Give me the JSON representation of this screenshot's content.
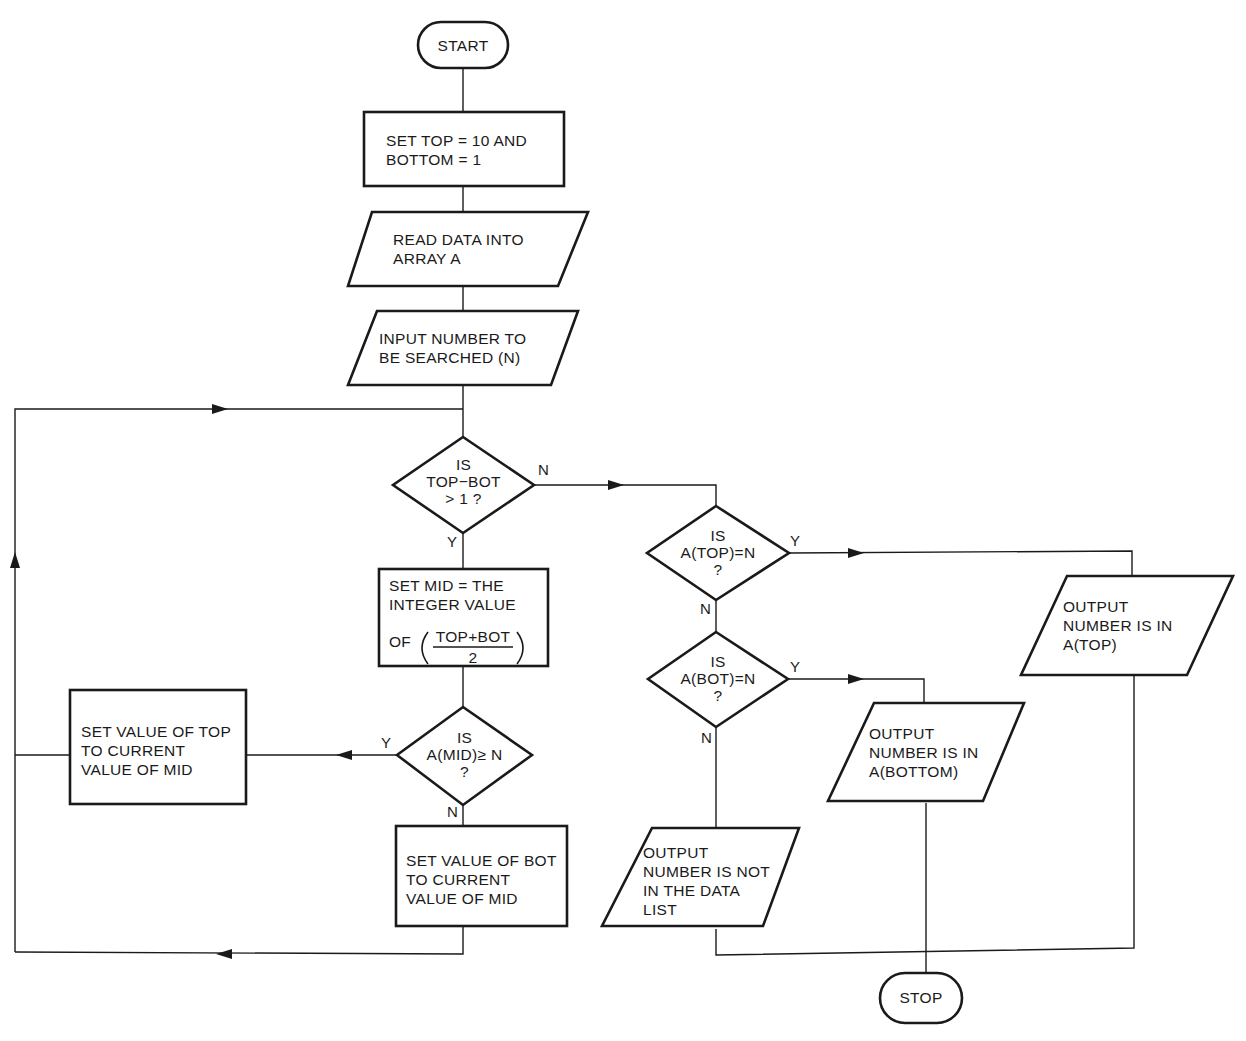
{
  "flowchart": {
    "start": "START",
    "stop": "STOP",
    "init": "SET TOP = 10 AND\nBOTTOM = 1",
    "read": "READ DATA INTO\nARRAY A",
    "input": "INPUT NUMBER TO\nBE SEARCHED (N)",
    "decision_range": "IS\nTOP−BOT\n> 1 ?",
    "set_mid_line1": "SET MID = THE\nINTEGER VALUE",
    "set_mid_of": "OF",
    "set_mid_num": "TOP+BOT",
    "set_mid_den": "2",
    "decision_mid": "IS\nA(MID)≥ N\n?",
    "set_top": "SET VALUE OF TOP\nTO CURRENT\nVALUE OF MID",
    "set_bot": "SET VALUE OF BOT\nTO CURRENT\nVALUE OF MID",
    "decision_top": "IS\nA(TOP)=N\n?",
    "decision_bot": "IS\nA(BOT)=N\n?",
    "out_top": "OUTPUT\nNUMBER IS IN\nA(TOP)",
    "out_bottom": "OUTPUT\nNUMBER IS IN\nA(BOTTOM)",
    "out_not_found": "OUTPUT\nNUMBER IS NOT\nIN THE DATA\nLIST",
    "labels": {
      "range_no": "N",
      "range_yes": "Y",
      "mid_yes": "Y",
      "mid_no": "N",
      "top_yes": "Y",
      "top_no": "N",
      "bot_yes": "Y",
      "bot_no": "N"
    }
  }
}
